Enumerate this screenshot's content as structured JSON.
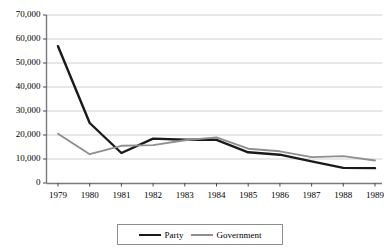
{
  "chart_data": {
    "type": "line",
    "title": "",
    "xlabel": "",
    "ylabel": "",
    "categories": [
      "1979",
      "1980",
      "1981",
      "1982",
      "1983",
      "1984",
      "1985",
      "1986",
      "1987",
      "1988",
      "1989"
    ],
    "series": [
      {
        "name": "Party",
        "color": "#1a1a1a",
        "values": [
          57000,
          25000,
          12500,
          18500,
          18000,
          18000,
          12800,
          11800,
          9000,
          6300,
          6200
        ]
      },
      {
        "name": "Government",
        "color": "#8f8f8f",
        "values": [
          20500,
          12000,
          15500,
          15800,
          17800,
          19000,
          14300,
          13200,
          10800,
          11200,
          9400
        ]
      }
    ],
    "ylim": [
      0,
      70000
    ],
    "ytick_values": [
      0,
      10000,
      20000,
      30000,
      40000,
      50000,
      60000,
      70000
    ],
    "ytick_labels": [
      "0",
      "10,000",
      "20,000",
      "30,000",
      "40,000",
      "50,000",
      "60,000",
      "70,000"
    ],
    "grid": true,
    "grid_axis": "y",
    "legend_position": "bottom"
  },
  "axes": {
    "y_axis_name": "value-axis",
    "x_axis_name": "year-axis"
  },
  "legend": {
    "items": [
      {
        "label": "Party",
        "swatch": "line-swatch-dark"
      },
      {
        "label": "Government",
        "swatch": "line-swatch-gray"
      }
    ]
  }
}
